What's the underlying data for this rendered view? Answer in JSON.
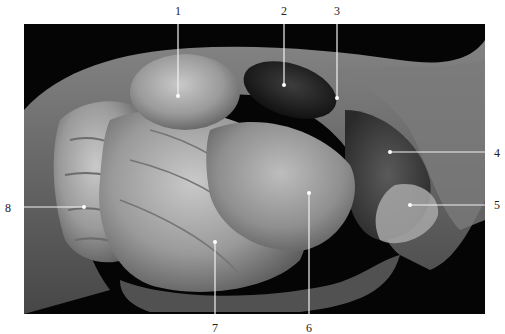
{
  "figure": {
    "type": "anatomical-dissection-photo",
    "tone": "grayscale",
    "photo_bounds": {
      "x": 24,
      "y": 24,
      "w": 461,
      "h": 290
    },
    "colors": {
      "background": "#ffffff",
      "photo_bg": "#050505",
      "leader_line": "#f2f2f2",
      "label_text": "#222222"
    }
  },
  "labels": [
    {
      "id": "1",
      "text": "1",
      "text_pos": [
        178,
        10
      ],
      "dot": [
        178,
        96
      ],
      "direction": "top"
    },
    {
      "id": "2",
      "text": "2",
      "text_pos": [
        284,
        10
      ],
      "dot": [
        284,
        85
      ],
      "direction": "top"
    },
    {
      "id": "3",
      "text": "3",
      "text_pos": [
        337,
        10
      ],
      "dot": [
        337,
        98
      ],
      "direction": "top"
    },
    {
      "id": "4",
      "text": "4",
      "text_pos": [
        497,
        153
      ],
      "dot": [
        390,
        152
      ],
      "direction": "right"
    },
    {
      "id": "5",
      "text": "5",
      "text_pos": [
        497,
        205
      ],
      "dot": [
        410,
        205
      ],
      "direction": "right"
    },
    {
      "id": "6",
      "text": "6",
      "text_pos": [
        309,
        329
      ],
      "dot": [
        309,
        193
      ],
      "direction": "bottom"
    },
    {
      "id": "7",
      "text": "7",
      "text_pos": [
        215,
        329
      ],
      "dot": [
        215,
        242
      ],
      "direction": "bottom"
    },
    {
      "id": "8",
      "text": "8",
      "text_pos": [
        8,
        208
      ],
      "dot": [
        84,
        207
      ],
      "direction": "left"
    }
  ]
}
